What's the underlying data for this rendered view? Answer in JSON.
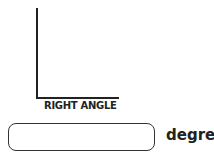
{
  "figure": {
    "label": "RIGHT ANGLE",
    "line_color": "#222222"
  },
  "answer": {
    "value": "",
    "placeholder": "",
    "unit": "degree"
  }
}
